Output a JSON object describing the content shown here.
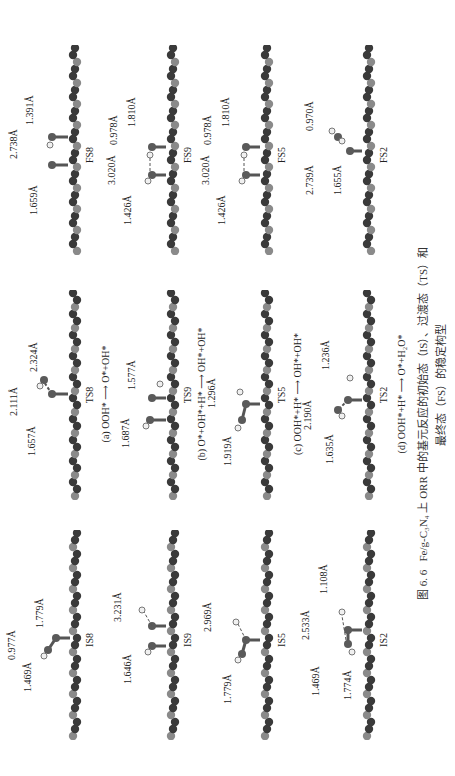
{
  "figure": {
    "number": "图 6. 6",
    "caption_line1": "Fe/g-C₃N₄ 上 ORR 中的基元反应的初始态（IS）、过渡态（TS）和",
    "caption_line2": "最终态（FS）的稳定构型",
    "rows": [
      {
        "reaction": "(a) OOH* ⟶ O*+OH*",
        "panels": [
          {
            "label": "IS8",
            "distances": [
              "1.469Å",
              "0.977Å",
              "1.779Å"
            ]
          },
          {
            "label": "TS8",
            "distances": [
              "1.657Å",
              "2.111Å",
              "2.324Å"
            ]
          },
          {
            "label": "FS8",
            "distances": [
              "1.659Å",
              "2.738Å",
              "1.391Å"
            ]
          }
        ]
      },
      {
        "reaction": "(b) O*+OH*+H* ⟶ OH*+OH*",
        "panels": [
          {
            "label": "IS9",
            "distances": [
              "1.646Å",
              "3.231Å"
            ]
          },
          {
            "label": "TS9",
            "distances": [
              "1.687Å",
              "1.577Å"
            ]
          },
          {
            "label": "FS9",
            "distances": [
              "1.426Å",
              "3.020Å",
              "0.978Å",
              "1.810Å"
            ]
          }
        ]
      },
      {
        "reaction": "(c) OOH*+H* ⟶ OH*+OH*",
        "panels": [
          {
            "label": "IS5",
            "distances": [
              "1.779Å",
              "2.969Å"
            ]
          },
          {
            "label": "TS5",
            "distances": [
              "1.919Å",
              "1.296Å"
            ]
          },
          {
            "label": "FS5",
            "distances": [
              "1.426Å",
              "3.020Å",
              "0.978Å",
              "1.810Å"
            ]
          }
        ]
      },
      {
        "reaction": "(d) OOH*+H* ⟶ O*+H₂O*",
        "panels": [
          {
            "label": "IS2",
            "distances": [
              "1.469Å",
              "1.774Å",
              "2.533Å",
              "1.108Å"
            ]
          },
          {
            "label": "TS2",
            "distances": [
              "1.635Å",
              "2.190Å",
              "1.236Å"
            ]
          },
          {
            "label": "FS2",
            "distances": [
              "1.655Å",
              "2.739Å",
              "0.970Å"
            ]
          }
        ]
      }
    ]
  },
  "colors": {
    "carbon": "#3a3a3a",
    "nitrogen": "#8a8a8a",
    "iron": "#6a6a6a",
    "oxygen": "#5a5a5a",
    "hydrogen": "#f0f0f0"
  }
}
